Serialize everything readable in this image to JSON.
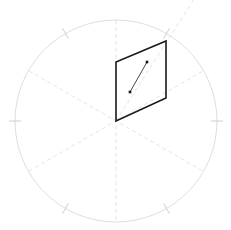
{
  "figure": {
    "width": 231,
    "height": 230,
    "background_color": "#ffffff"
  },
  "colors": {
    "circle_stroke": "#d0d0d0",
    "guide_line": "#d8d8d8",
    "tick_mark": "#c8c8c8",
    "plane_outline": "#1a1a1a",
    "lineation": "#333333",
    "marker_fill": "#111111"
  },
  "chart_data": {
    "type": "scatter",
    "xlabel": "",
    "ylabel": "",
    "projection": "stereonet-equal-area",
    "grid": false,
    "legend": null,
    "primitive_circle": {
      "center_x": 116,
      "center_y": 121,
      "radius": 101,
      "stroke_width": 0.7
    },
    "guide_lines": [
      {
        "name": "vertical-axis",
        "angle_deg": 90,
        "x1": 116,
        "y1": 20,
        "x2": 116,
        "y2": 222,
        "dash": "4,3"
      },
      {
        "name": "diagonal-axis-ne",
        "angle_deg": 30,
        "x1": 29,
        "y1": 171,
        "x2": 203,
        "y2": 71,
        "dash": "4,3"
      },
      {
        "name": "diagonal-axis-nw",
        "angle_deg": 150,
        "x1": 29,
        "y1": 71,
        "x2": 203,
        "y2": 171,
        "dash": "4,3"
      },
      {
        "name": "plane-strike-extension",
        "x1": 116,
        "y1": 121,
        "x2": 196,
        "y2": -4,
        "dash": "4,3"
      }
    ],
    "tick_marks": [
      {
        "name": "tick-west",
        "angle_deg": 180,
        "x": 15,
        "y": 121
      },
      {
        "name": "tick-east",
        "angle_deg": 0,
        "x": 217,
        "y": 121
      },
      {
        "name": "tick-northwest",
        "angle_deg": 120,
        "x": 66,
        "y": 33
      },
      {
        "name": "tick-northeast",
        "angle_deg": 60,
        "x": 166,
        "y": 33
      },
      {
        "name": "tick-southwest",
        "angle_deg": 240,
        "x": 66,
        "y": 209
      },
      {
        "name": "tick-southeast",
        "angle_deg": 300,
        "x": 166,
        "y": 209
      }
    ],
    "plane_polygon": {
      "name": "fault-plane-parallelogram",
      "vertices": [
        {
          "label": "origin",
          "x": 116,
          "y": 121
        },
        {
          "label": "top-left",
          "x": 116,
          "y": 62
        },
        {
          "label": "top-right",
          "x": 166,
          "y": 41
        },
        {
          "label": "bottom-right",
          "x": 166,
          "y": 98
        }
      ],
      "stroke_width": 1.6,
      "fill": "none"
    },
    "lineation": {
      "name": "slip-lineation-vector",
      "x1": 130,
      "y1": 92,
      "x2": 147,
      "y2": 62,
      "stroke_width": 0.9
    },
    "points": [
      {
        "name": "lineation-start-marker",
        "x": 130,
        "y": 92,
        "size": 2.6,
        "shape": "square"
      },
      {
        "name": "lineation-end-marker",
        "x": 147,
        "y": 62,
        "size": 2.6,
        "shape": "square"
      }
    ]
  }
}
